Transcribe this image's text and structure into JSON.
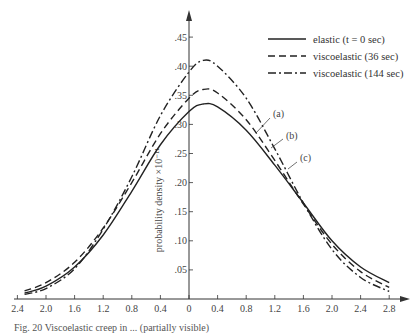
{
  "chart_data": {
    "type": "line",
    "title": "",
    "xlabel": "",
    "ylabel": "probability density ×10⁻¹¹",
    "x_tick_labels": [
      "2.4",
      "2.0",
      "1.6",
      "1.2",
      "0.8",
      "0.4",
      "0",
      "0.4",
      "0.8",
      "1.2",
      "1.6",
      "2.0",
      "2.4",
      "2.8"
    ],
    "x_tick_values": [
      -2.4,
      -2.0,
      -1.6,
      -1.2,
      -0.8,
      -0.4,
      0,
      0.4,
      0.8,
      1.2,
      1.6,
      2.0,
      2.4,
      2.8
    ],
    "y_tick_labels": [
      ".05",
      ".10",
      ".15",
      ".20",
      ".25",
      ".30",
      ".35",
      ".40",
      ".45"
    ],
    "y_tick_values": [
      0.05,
      0.1,
      0.15,
      0.2,
      0.25,
      0.3,
      0.35,
      0.4,
      0.45
    ],
    "xlim": [
      -2.5,
      3.0
    ],
    "ylim": [
      0,
      0.48
    ],
    "grid": false,
    "legend_position": "upper right",
    "x": [
      -2.3,
      -2.0,
      -1.6,
      -1.2,
      -0.8,
      -0.4,
      0,
      0.2,
      0.4,
      0.8,
      1.2,
      1.6,
      2.0,
      2.4,
      2.8
    ],
    "series": [
      {
        "name": "elastic (t = 0 sec)",
        "style": "solid",
        "peak": 0.335,
        "peak_x": 0.2,
        "values": [
          0.01,
          0.022,
          0.055,
          0.11,
          0.185,
          0.265,
          0.322,
          0.335,
          0.33,
          0.29,
          0.23,
          0.165,
          0.1,
          0.055,
          0.028
        ]
      },
      {
        "name": "viscoelastic (36 sec)",
        "style": "dashed",
        "peak": 0.36,
        "peak_x": 0.2,
        "values": [
          0.014,
          0.028,
          0.063,
          0.122,
          0.2,
          0.284,
          0.345,
          0.36,
          0.354,
          0.308,
          0.238,
          0.163,
          0.094,
          0.047,
          0.02
        ]
      },
      {
        "name": "viscoelastic (144 sec)",
        "style": "dash-dot",
        "peak": 0.41,
        "peak_x": 0.2,
        "values": [
          0.008,
          0.018,
          0.052,
          0.12,
          0.21,
          0.315,
          0.39,
          0.41,
          0.4,
          0.345,
          0.258,
          0.165,
          0.085,
          0.037,
          0.013
        ]
      }
    ],
    "annotations": [
      {
        "text": "(a)",
        "x": 1.15,
        "y": 0.29
      },
      {
        "text": "(b)",
        "x": 1.45,
        "y": 0.255
      },
      {
        "text": "(c)",
        "x": 1.75,
        "y": 0.215
      }
    ]
  },
  "legend": {
    "items": [
      {
        "label": "elastic (t = 0 sec)",
        "style": "solid"
      },
      {
        "label": "viscoelastic (36 sec)",
        "style": "dashed"
      },
      {
        "label": "viscoelastic (144 sec)",
        "style": "dash-dot"
      }
    ]
  },
  "axis": {
    "ylabel": "probability density ×10⁻¹¹"
  },
  "annotations": [
    "(a)",
    "(b)",
    "(c)"
  ],
  "caption": "Fig. 20  Viscoelastic creep in ... (partially visible)"
}
